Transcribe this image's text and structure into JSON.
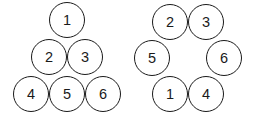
{
  "canvas": {
    "width": 259,
    "height": 120,
    "background": "#ffffff"
  },
  "style": {
    "circle_diameter": 36,
    "circle_fill": "#ffffff",
    "circle_stroke": "#1a1a1a",
    "circle_stroke_width": 1.6,
    "number_color": "#1a1a1a",
    "number_font_size": 14.5
  },
  "figures": [
    {
      "name": "triangle-arrangement",
      "shape": "triangle",
      "rows": 3,
      "nodes": [
        {
          "label": "1",
          "row": 1,
          "col": 1,
          "cx": 67,
          "cy": 20
        },
        {
          "label": "2",
          "row": 2,
          "col": 1,
          "cx": 49,
          "cy": 57
        },
        {
          "label": "3",
          "row": 2,
          "col": 2,
          "cx": 85,
          "cy": 57
        },
        {
          "label": "4",
          "row": 3,
          "col": 1,
          "cx": 31,
          "cy": 94
        },
        {
          "label": "5",
          "row": 3,
          "col": 2,
          "cx": 67,
          "cy": 94
        },
        {
          "label": "6",
          "row": 3,
          "col": 3,
          "cx": 103,
          "cy": 94
        }
      ]
    },
    {
      "name": "hexagon-ring-arrangement",
      "shape": "hexagonal-ring",
      "rows": 3,
      "nodes": [
        {
          "label": "2",
          "row": 1,
          "col": 1,
          "cx": 170,
          "cy": 22
        },
        {
          "label": "3",
          "row": 1,
          "col": 2,
          "cx": 206,
          "cy": 22
        },
        {
          "label": "5",
          "row": 2,
          "col": 1,
          "cx": 152,
          "cy": 58
        },
        {
          "label": "6",
          "row": 2,
          "col": 2,
          "cx": 224,
          "cy": 58
        },
        {
          "label": "1",
          "row": 3,
          "col": 1,
          "cx": 170,
          "cy": 94
        },
        {
          "label": "4",
          "row": 3,
          "col": 2,
          "cx": 206,
          "cy": 94
        }
      ]
    }
  ]
}
